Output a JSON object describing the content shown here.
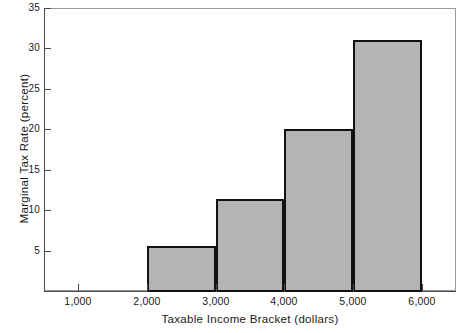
{
  "chart_data": {
    "type": "bar",
    "title": "",
    "xlabel": "Taxable Income Bracket (dollars)",
    "ylabel": "Marginal Tax Rate (percent)",
    "xlim": [
      500,
      6500
    ],
    "ylim": [
      0,
      35
    ],
    "grid": false,
    "legend": "none",
    "bar_style": {
      "fill_color": "#b4b4b4",
      "edge_color": "#111111",
      "edge_width_px": 2
    },
    "axis_style": {
      "frame_color": "#9a9a9a",
      "axis_color": "#4a4a4a",
      "tick_direction": "in"
    },
    "x_ticks": [
      {
        "value": 1000,
        "label": "1,000"
      },
      {
        "value": 2000,
        "label": "2,000"
      },
      {
        "value": 3000,
        "label": "3,000"
      },
      {
        "value": 4000,
        "label": "4,000"
      },
      {
        "value": 5000,
        "label": "5,000"
      },
      {
        "value": 6000,
        "label": "6,000"
      }
    ],
    "y_ticks": [
      {
        "value": 5,
        "label": "5"
      },
      {
        "value": 10,
        "label": "10"
      },
      {
        "value": 15,
        "label": "15"
      },
      {
        "value": 20,
        "label": "20"
      },
      {
        "value": 25,
        "label": "25"
      },
      {
        "value": 30,
        "label": "30"
      },
      {
        "value": 35,
        "label": "35"
      }
    ],
    "categories": [
      "2,000-3,000",
      "3,000-4,000",
      "4,000-5,000",
      "5,000-6,000"
    ],
    "values": [
      5.6,
      11.4,
      20.0,
      31.0
    ],
    "bars": [
      {
        "x_start": 2000,
        "x_end": 3000,
        "value": 5.6,
        "label": "2,000-3,000"
      },
      {
        "x_start": 3000,
        "x_end": 4000,
        "value": 11.4,
        "label": "3,000-4,000"
      },
      {
        "x_start": 4000,
        "x_end": 5000,
        "value": 20.0,
        "label": "4,000-5,000"
      },
      {
        "x_start": 5000,
        "x_end": 6000,
        "value": 31.0,
        "label": "5,000-6,000"
      }
    ]
  }
}
